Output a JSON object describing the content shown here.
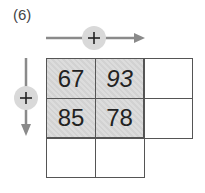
{
  "problem_label": "(6)",
  "operations": {
    "horizontal": {
      "symbol": "+",
      "direction": "right"
    },
    "vertical": {
      "symbol": "+",
      "direction": "down"
    }
  },
  "grid": {
    "rows": [
      [
        {
          "value": "67",
          "shaded": true
        },
        {
          "value": "93",
          "shaded": true
        },
        {
          "value": "",
          "shaded": false
        }
      ],
      [
        {
          "value": "85",
          "shaded": true
        },
        {
          "value": "78",
          "shaded": true
        },
        {
          "value": "",
          "shaded": false
        }
      ],
      [
        {
          "value": "",
          "shaded": false
        },
        {
          "value": "",
          "shaded": false
        }
      ]
    ]
  },
  "colors": {
    "arrow": "#8a8a8a",
    "circle": "#d9d9d9",
    "grid_line": "#555555",
    "shade": "#d6d6d6"
  }
}
